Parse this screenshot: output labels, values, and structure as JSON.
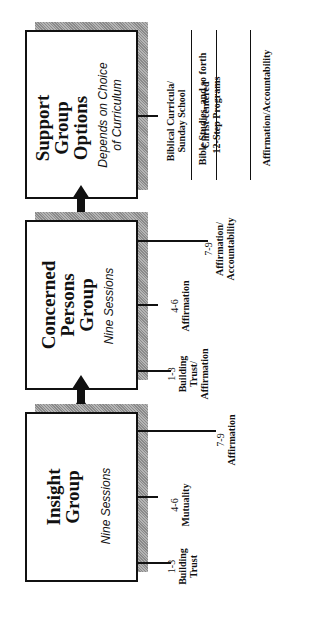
{
  "diagram": {
    "type": "flow",
    "orientation": "rotated-90-ccw",
    "flow_direction": "Insight Group -> Concerned Persons Group -> Support Group Options"
  },
  "boxes": [
    {
      "id": "support",
      "title_lines": [
        "Support",
        "Group",
        "Options"
      ],
      "subtitle_lines": [
        "Depends on Choice",
        "of Curriculum"
      ]
    },
    {
      "id": "concerned",
      "title_lines": [
        "Concerned",
        "Persons",
        "Group"
      ],
      "subtitle_lines": [
        "Nine Sessions"
      ]
    },
    {
      "id": "insight",
      "title_lines": [
        "Insight",
        "Group"
      ],
      "subtitle_lines": [
        "Nine Sessions"
      ]
    }
  ],
  "support_options": [
    [
      "Biblical Curricula/",
      "Sunday School"
    ],
    [
      "Bible Studies, and so forth"
    ],
    [
      "Christ-centered",
      "12-Step Programs"
    ],
    [
      "Affirmation/Accountability"
    ]
  ],
  "concerned_sessions": [
    {
      "range": "1-3",
      "topic_lines": [
        "Building",
        "Trust/",
        "Affirmation"
      ]
    },
    {
      "range": "4-6",
      "topic_lines": [
        "Affirmation"
      ]
    },
    {
      "range": "7-9",
      "topic_lines": [
        "Affirmation/",
        "Accountability"
      ]
    }
  ],
  "insight_sessions": [
    {
      "range": "1-3",
      "topic_lines": [
        "Building",
        "Trust"
      ]
    },
    {
      "range": "4-6",
      "topic_lines": [
        "Mutuality"
      ]
    },
    {
      "range": "7-9",
      "topic_lines": [
        "Affirmation"
      ]
    }
  ],
  "colors": {
    "line": "#111111",
    "shadow": "#9a9a9a",
    "background": "#ffffff"
  }
}
